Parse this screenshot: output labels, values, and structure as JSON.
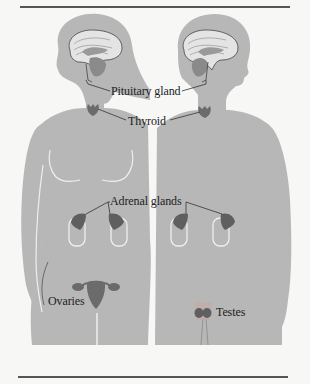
{
  "figure": {
    "labels": {
      "pituitary": "Pituitary gland",
      "thyroid": "Thyroid",
      "adrenal": "Adrenal glands",
      "ovaries": "Ovaries",
      "testes": "Testes"
    },
    "figures": [
      "female",
      "male"
    ],
    "colors": {
      "background": "#f7f7f6",
      "silhouette": "#b7b7b7",
      "gland": "#6b6b6b",
      "gland_dark": "#555555",
      "brain_light": "#e8e8e8",
      "outline": "#ededed",
      "rule": "#555555",
      "text": "#222222"
    }
  }
}
